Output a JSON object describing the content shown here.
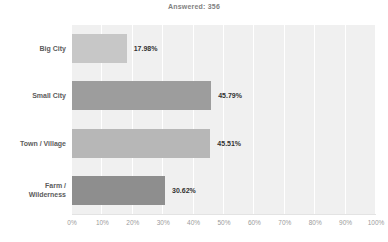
{
  "header": {
    "answered_label": "Answered: 356"
  },
  "chart_data": {
    "type": "bar",
    "orientation": "horizontal",
    "title": "Answered: 356",
    "categories": [
      "Big City",
      "Small City",
      "Town / Village",
      "Farm / Wilderness"
    ],
    "values": [
      17.98,
      45.79,
      45.51,
      30.62
    ],
    "value_labels": [
      "17.98%",
      "45.79%",
      "45.51%",
      "30.62%"
    ],
    "bar_colors": [
      "#c7c7c7",
      "#9d9d9d",
      "#b7b7b7",
      "#8e8e8e"
    ],
    "xlabel": "",
    "ylabel": "",
    "xlim": [
      0,
      100
    ],
    "x_ticks": [
      "0%",
      "10%",
      "20%",
      "30%",
      "40%",
      "50%",
      "60%",
      "70%",
      "80%",
      "90%",
      "100%"
    ],
    "grid": true,
    "legend": false,
    "plot_background": "#f0f0f0",
    "gridline_color": "#ffffff",
    "label_color": "#5c5c5c",
    "value_label_color": "#323232",
    "tick_color": "#9b9b9b"
  }
}
